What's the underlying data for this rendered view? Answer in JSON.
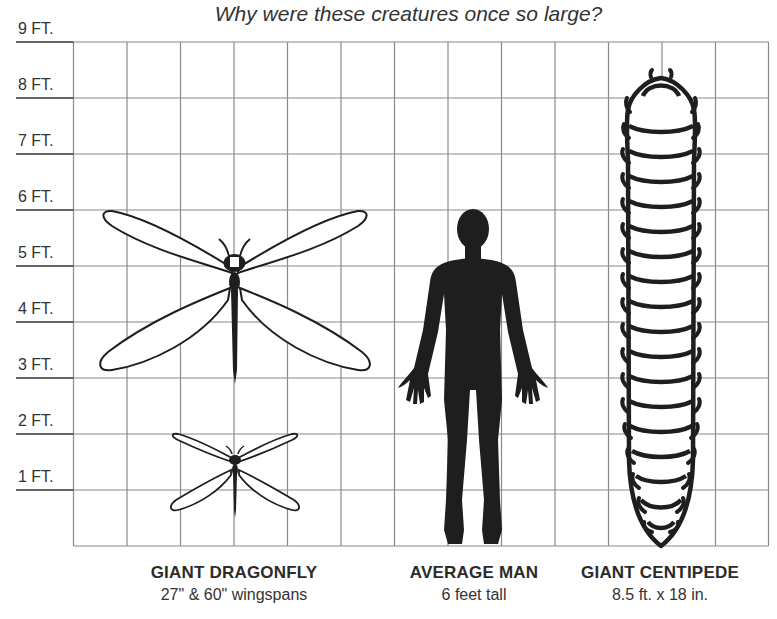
{
  "title": "Why were these creatures once so large?",
  "y_axis": {
    "unit": "FT.",
    "labels": [
      "9 FT.",
      "8 FT.",
      "7 FT.",
      "6 FT.",
      "5 FT.",
      "4 FT.",
      "3 FT.",
      "2 FT.",
      "1 FT."
    ]
  },
  "grid": {
    "columns": 13,
    "rows": 9,
    "line_color": "#8a8a8a",
    "axis_line_color": "#333333"
  },
  "figures": [
    {
      "name": "GIANT DRAGONFLY",
      "subtitle": "27\" & 60\" wingspans",
      "icon": "dragonfly-icon"
    },
    {
      "name": "AVERAGE MAN",
      "subtitle": "6 feet tall",
      "icon": "human-silhouette-icon"
    },
    {
      "name": "GIANT CENTIPEDE",
      "subtitle": "8.5 ft. x 18 in.",
      "icon": "centipede-icon"
    }
  ],
  "colors": {
    "figure_fill": "#1e1e1e",
    "outline": "#1e1e1e",
    "background": "#ffffff"
  }
}
